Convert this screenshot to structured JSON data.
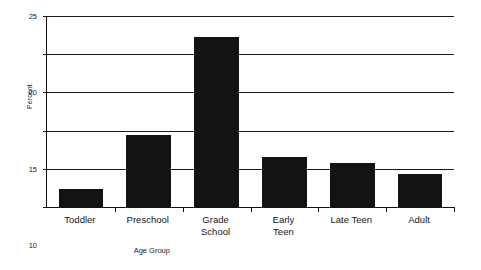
{
  "chart_data": {
    "type": "bar",
    "title": "",
    "xlabel": "Age Group",
    "ylabel": "Percent",
    "categories": [
      "Toddler",
      "Preschool",
      "Grade School",
      "Early Teen",
      "Late Teen",
      "Adult"
    ],
    "category_lines": [
      [
        "Toddler"
      ],
      [
        "Preschool"
      ],
      [
        "Grade",
        "School"
      ],
      [
        "Early",
        "Teen"
      ],
      [
        "Late Teen"
      ],
      [
        "Adult"
      ]
    ],
    "values": [
      2.3,
      9.4,
      22.3,
      6.5,
      5.8,
      4.3
    ],
    "ylim": [
      0,
      25
    ],
    "yticks": [
      0,
      5,
      10,
      15,
      20,
      25
    ],
    "ytick_labels": [
      "0",
      "5",
      "10",
      "15",
      "20",
      "25"
    ],
    "grid": true,
    "grid_axis": "y",
    "legend": false,
    "bar_color": "#131313",
    "background_color": "#ffffff",
    "axis_color": "#111111"
  },
  "axes": {
    "y_title": "Percent",
    "x_title": "Age Group"
  }
}
